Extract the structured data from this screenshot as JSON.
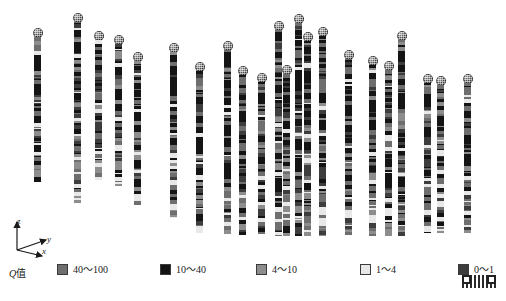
{
  "figure": {
    "kind": "borehole-q-value-3d-scatter",
    "background": "#ffffff"
  },
  "axes": {
    "z_label": "z",
    "y_label": "y",
    "x_label": "x"
  },
  "legend": {
    "title_prefix": "Q",
    "title_suffix": "值",
    "items": [
      {
        "label": "40～100",
        "color": "#6e6e6e",
        "x": 57
      },
      {
        "label": "10～40",
        "color": "#141414",
        "x": 160
      },
      {
        "label": "4～10",
        "color": "#8d8d8d",
        "x": 256
      },
      {
        "label": "1～4",
        "color": "#e8e8e8",
        "x": 360
      },
      {
        "label": "0～1",
        "color": "#3d3d3d",
        "x": 458
      }
    ]
  },
  "chart_data": {
    "type": "scatter",
    "title": "",
    "xlabel": "x",
    "ylabel": "y",
    "zlabel": "z",
    "grid": false,
    "legend_position": "bottom",
    "value_name": "Q值",
    "classes": [
      {
        "range": "40～100",
        "min": 40,
        "max": 100,
        "color": "#6e6e6e"
      },
      {
        "range": "10～40",
        "min": 10,
        "max": 40,
        "color": "#141414"
      },
      {
        "range": "4～10",
        "min": 4,
        "max": 10,
        "color": "#8d8d8d"
      },
      {
        "range": "1～4",
        "min": 1,
        "max": 4,
        "color": "#e8e8e8"
      },
      {
        "range": "0～1",
        "min": 0,
        "max": 1,
        "color": "#3d3d3d"
      }
    ],
    "boreholes": [
      {
        "id": "BH-01",
        "x": 34,
        "collar_y": 28,
        "bottom_y": 182,
        "seed": 11
      },
      {
        "id": "BH-02",
        "x": 74,
        "collar_y": 13,
        "bottom_y": 203,
        "seed": 23
      },
      {
        "id": "BH-03",
        "x": 95,
        "collar_y": 31,
        "bottom_y": 180,
        "seed": 37
      },
      {
        "id": "BH-04",
        "x": 115,
        "collar_y": 35,
        "bottom_y": 186,
        "seed": 41
      },
      {
        "id": "BH-05",
        "x": 134,
        "collar_y": 52,
        "bottom_y": 205,
        "seed": 53
      },
      {
        "id": "BH-06",
        "x": 170,
        "collar_y": 43,
        "bottom_y": 218,
        "seed": 67
      },
      {
        "id": "BH-07",
        "x": 196,
        "collar_y": 62,
        "bottom_y": 233,
        "seed": 71
      },
      {
        "id": "BH-08",
        "x": 224,
        "collar_y": 41,
        "bottom_y": 234,
        "seed": 83
      },
      {
        "id": "BH-09",
        "x": 239,
        "collar_y": 66,
        "bottom_y": 235,
        "seed": 97
      },
      {
        "id": "BH-10",
        "x": 258,
        "collar_y": 73,
        "bottom_y": 234,
        "seed": 103
      },
      {
        "id": "BH-11",
        "x": 275,
        "collar_y": 21,
        "bottom_y": 236,
        "seed": 113
      },
      {
        "id": "BH-12",
        "x": 283,
        "collar_y": 65,
        "bottom_y": 236,
        "seed": 127
      },
      {
        "id": "BH-13",
        "x": 295,
        "collar_y": 14,
        "bottom_y": 236,
        "seed": 131
      },
      {
        "id": "BH-14",
        "x": 304,
        "collar_y": 32,
        "bottom_y": 236,
        "seed": 139
      },
      {
        "id": "BH-15",
        "x": 319,
        "collar_y": 27,
        "bottom_y": 236,
        "seed": 149
      },
      {
        "id": "BH-16",
        "x": 345,
        "collar_y": 50,
        "bottom_y": 235,
        "seed": 151
      },
      {
        "id": "BH-17",
        "x": 369,
        "collar_y": 56,
        "bottom_y": 236,
        "seed": 163
      },
      {
        "id": "BH-18",
        "x": 385,
        "collar_y": 61,
        "bottom_y": 236,
        "seed": 173
      },
      {
        "id": "BH-19",
        "x": 398,
        "collar_y": 31,
        "bottom_y": 236,
        "seed": 181
      },
      {
        "id": "BH-20",
        "x": 424,
        "collar_y": 74,
        "bottom_y": 233,
        "seed": 191
      },
      {
        "id": "BH-21",
        "x": 437,
        "collar_y": 76,
        "bottom_y": 233,
        "seed": 197
      },
      {
        "id": "BH-22",
        "x": 464,
        "collar_y": 74,
        "bottom_y": 233,
        "seed": 211
      }
    ]
  }
}
